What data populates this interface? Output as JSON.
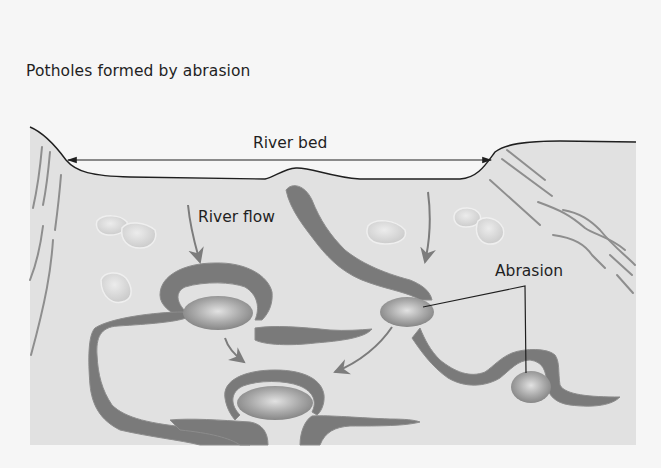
{
  "diagram": {
    "title": "Potholes formed by abrasion",
    "labels": {
      "river_bed": "River bed",
      "river_flow": "River flow",
      "abrasion": "Abrasion"
    },
    "colors": {
      "page_background": "#f6f6f6",
      "rock": "#e1e1e1",
      "channel": "#7a7a7a",
      "channel_edge": "#8c8c8c",
      "pothole_light": "#d9d9d9",
      "pothole_dark": "#8a8a8a",
      "arrow": "#7c7c7c",
      "strata": "#8e8e8e",
      "pebble": "#d4d4d4",
      "line": "#1f1f1f"
    },
    "elements": {
      "potholes": [
        {
          "name": "upper-left-pothole",
          "cx": 218,
          "cy": 313,
          "rx": 35,
          "ry": 18
        },
        {
          "name": "middle-pothole",
          "cx": 407,
          "cy": 312,
          "rx": 27,
          "ry": 16
        },
        {
          "name": "bottom-pothole",
          "cx": 275,
          "cy": 403,
          "rx": 38,
          "ry": 18
        },
        {
          "name": "right-pothole",
          "cx": 531,
          "cy": 387,
          "rx": 20,
          "ry": 16
        }
      ]
    }
  }
}
